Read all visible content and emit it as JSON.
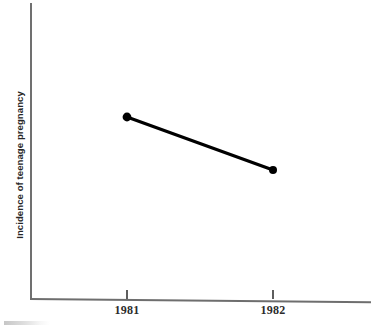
{
  "chart_data": {
    "type": "line",
    "title": "",
    "subtitle": "",
    "xlabel": "",
    "ylabel": "Incidence of teenage pregnancy",
    "categories": [
      "1981",
      "1982"
    ],
    "x": [
      1981,
      1982
    ],
    "series": [
      {
        "name": "Incidence of teenage pregnancy",
        "values": [
          0.62,
          0.44
        ],
        "color": "#000000",
        "marker": "filled-circle",
        "line_style": "solid"
      }
    ],
    "points": [
      {
        "x_label": "1981",
        "px": 127,
        "py": 117,
        "value": 0.62
      },
      {
        "x_label": "1982",
        "px": 273,
        "py": 170,
        "value": 0.44
      }
    ],
    "trend": "decreasing",
    "grid": false,
    "legend": false,
    "legend_position": "none",
    "y_axis_ticks": [],
    "y_axis_labeled": false,
    "ylim": [
      0,
      1
    ],
    "axis_color": "#6e6e6e",
    "background_color": "#ffffff"
  },
  "axes": {
    "y_label": "Incidence of teenage pregnancy",
    "x_ticks": [
      {
        "label": "1981",
        "x": 127
      },
      {
        "label": "1982",
        "x": 273
      }
    ]
  },
  "figure": {
    "caption_fragment": ""
  }
}
